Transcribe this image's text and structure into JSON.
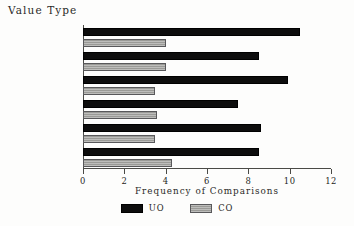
{
  "chart_data": {
    "type": "bar",
    "orientation": "horizontal",
    "title": "",
    "ylabel": "Value Type",
    "xlabel": "Frequency of Comparisons",
    "categories": [
      "Theoretical",
      "Economic",
      "Aesthetic",
      "Social",
      "Political",
      "Religious"
    ],
    "series": [
      {
        "name": "UO",
        "color": "#0d0d0d",
        "values": [
          10.5,
          8.5,
          9.9,
          7.5,
          8.6,
          8.5
        ]
      },
      {
        "name": "CO",
        "color": "#9a9a96",
        "values": [
          4.0,
          4.0,
          3.5,
          3.6,
          3.5,
          4.3
        ]
      }
    ],
    "xlim": [
      0,
      12
    ],
    "xticks": [
      0,
      2,
      4,
      6,
      8,
      10,
      12
    ],
    "xtick_labels": [
      "0",
      "2",
      "4",
      "6",
      "8",
      "10",
      "12"
    ],
    "grid": false,
    "legend_position": "bottom-center",
    "legend_entries": [
      "UO",
      "CO"
    ]
  }
}
